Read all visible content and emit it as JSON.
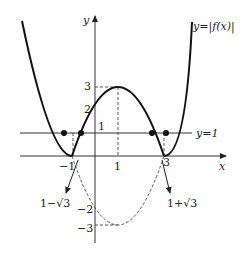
{
  "diagram": {
    "function_label": "y=|f(x)|",
    "line_label": "y=1",
    "axis_x_label": "x",
    "axis_y_label": "y",
    "y_ticks": [
      "3",
      "2",
      "1",
      "−2",
      "−3"
    ],
    "x_ticks": [
      "−1",
      "1",
      "3"
    ],
    "root_left_label": "1−√3",
    "root_right_label": "1+√3",
    "colors": {
      "curve": "#111111",
      "axis": "#333333",
      "dashed": "#444444"
    }
  }
}
